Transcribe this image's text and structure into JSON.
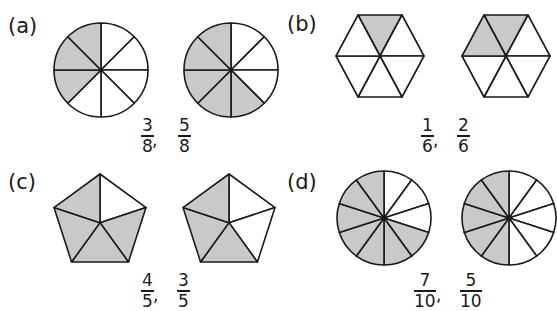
{
  "colors": {
    "shade": "#c9c9c9",
    "stroke": "#1a1a1a"
  },
  "problems": [
    {
      "label": "(a)",
      "shape": "circle",
      "parts": 8,
      "figures": [
        {
          "shaded_sectors": [
            5,
            6,
            7
          ]
        },
        {
          "shaded_sectors": [
            3,
            4,
            5,
            6,
            7
          ]
        }
      ],
      "fractions": [
        {
          "num": "3",
          "den": "8"
        },
        {
          "num": "5",
          "den": "8"
        }
      ],
      "separator": ","
    },
    {
      "label": "(b)",
      "shape": "hexagon",
      "parts": 6,
      "figures": [
        {
          "shaded_sectors": [
            0
          ]
        },
        {
          "shaded_sectors": [
            0,
            5
          ]
        }
      ],
      "fractions": [
        {
          "num": "1",
          "den": "6"
        },
        {
          "num": "2",
          "den": "6"
        }
      ],
      "separator": ","
    },
    {
      "label": "(c)",
      "shape": "pentagon",
      "parts": 5,
      "figures": [
        {
          "shaded_sectors": [
            1,
            2,
            3,
            4
          ]
        },
        {
          "shaded_sectors": [
            2,
            3,
            4
          ]
        }
      ],
      "fractions": [
        {
          "num": "4",
          "den": "5"
        },
        {
          "num": "3",
          "den": "5"
        }
      ],
      "separator": ","
    },
    {
      "label": "(d)",
      "shape": "circle",
      "parts": 10,
      "figures": [
        {
          "shaded_sectors": [
            3,
            4,
            5,
            6,
            7,
            8,
            9
          ]
        },
        {
          "shaded_sectors": [
            5,
            6,
            7,
            8,
            9
          ]
        }
      ],
      "fractions": [
        {
          "num": "7",
          "den": "10"
        },
        {
          "num": "5",
          "den": "10"
        }
      ],
      "separator": ","
    }
  ]
}
